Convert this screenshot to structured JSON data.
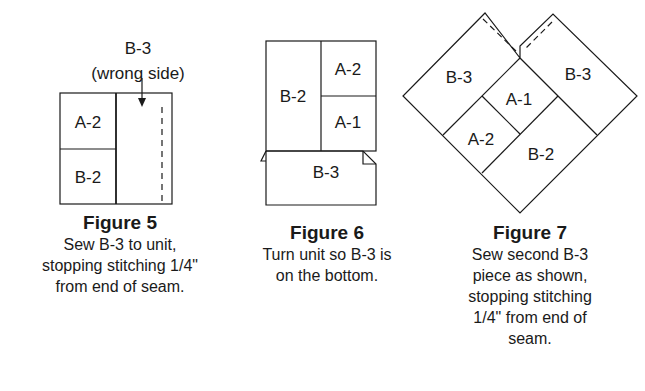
{
  "figures": [
    {
      "title": "Figure 5",
      "description": "Sew B-3 to unit,\nstopping stitching 1/4\"\nfrom end of seam.",
      "callout_line1": "B-3",
      "callout_line2": "(wrong side)",
      "pieces": {
        "top_left": "A-2",
        "bottom_left": "B-2"
      }
    },
    {
      "title": "Figure 6",
      "description": "Turn unit so B-3 is\non the bottom.",
      "pieces": {
        "left": "B-2",
        "top_right": "A-2",
        "bottom_right": "A-1",
        "bottom": "B-3"
      }
    },
    {
      "title": "Figure 7",
      "description": "Sew second B-3\npiece as shown,\nstopping stitching\n1/4\" from end of\nseam.",
      "pieces": {
        "left": "B-3",
        "right": "B-3",
        "center": "A-1",
        "lower_left": "A-2",
        "bottom": "B-2"
      }
    }
  ],
  "colors": {
    "line": "#1a1a1a",
    "background": "#ffffff"
  }
}
